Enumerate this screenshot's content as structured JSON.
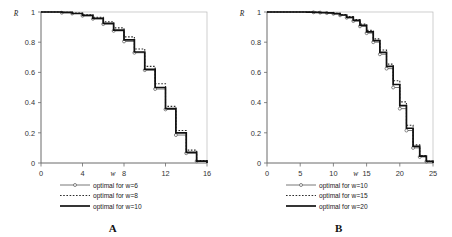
{
  "figure": {
    "panels": [
      {
        "id": "A",
        "caption": "A",
        "chart_data": {
          "type": "line",
          "title": "",
          "xlabel": "w",
          "ylabel": "R",
          "xlim": [
            0,
            16
          ],
          "ylim": [
            0,
            1
          ],
          "xticks": [
            0,
            4,
            8,
            12,
            16
          ],
          "xtick_labels": [
            "0",
            "4",
            "8",
            "12",
            "16"
          ],
          "yticks": [
            0,
            0.2,
            0.4,
            0.6,
            0.8,
            1
          ],
          "ytick_labels": [
            "0",
            "0.2",
            "0.4",
            "0.6",
            "0.8",
            "1"
          ],
          "grid": false,
          "legend_position": "below-axis",
          "step_style": "post",
          "series": [
            {
              "name": "optimal for w=6",
              "style": "thin-with-markers",
              "x": [
                0,
                1,
                2,
                3,
                4,
                5,
                6,
                7,
                8,
                9,
                10,
                11,
                12,
                13,
                14,
                15,
                16
              ],
              "values": [
                1.0,
                1.0,
                0.995,
                0.99,
                0.975,
                0.955,
                0.92,
                0.875,
                0.805,
                0.73,
                0.615,
                0.49,
                0.355,
                0.185,
                0.065,
                0.012,
                0.0
              ]
            },
            {
              "name": "optimal for w=8",
              "style": "dotted",
              "x": [
                0,
                1,
                2,
                3,
                4,
                5,
                6,
                7,
                8,
                9,
                10,
                11,
                12,
                13,
                14,
                15,
                16
              ],
              "values": [
                1.0,
                1.0,
                0.998,
                0.993,
                0.982,
                0.965,
                0.935,
                0.895,
                0.835,
                0.755,
                0.64,
                0.525,
                0.375,
                0.215,
                0.085,
                0.016,
                0.0
              ]
            },
            {
              "name": "optimal for w=10",
              "style": "thick",
              "x": [
                0,
                1,
                2,
                3,
                4,
                5,
                6,
                7,
                8,
                9,
                10,
                11,
                12,
                13,
                14,
                15,
                16
              ],
              "values": [
                1.0,
                1.0,
                0.997,
                0.99,
                0.978,
                0.958,
                0.925,
                0.88,
                0.815,
                0.735,
                0.62,
                0.5,
                0.36,
                0.2,
                0.07,
                0.013,
                0.0
              ]
            }
          ],
          "legend": [
            "optimal for w=6",
            "optimal for w=8",
            "optimal for w=10"
          ]
        }
      },
      {
        "id": "B",
        "caption": "B",
        "chart_data": {
          "type": "line",
          "title": "",
          "xlabel": "w",
          "ylabel": "R",
          "xlim": [
            0,
            25
          ],
          "ylim": [
            0,
            1
          ],
          "xticks": [
            0,
            5,
            10,
            15,
            20,
            25
          ],
          "xtick_labels": [
            "0",
            "5",
            "10",
            "15",
            "20",
            "25"
          ],
          "yticks": [
            0,
            0.2,
            0.4,
            0.6,
            0.8,
            1
          ],
          "ytick_labels": [
            "0",
            "0.2",
            "0.4",
            "0.6",
            "0.8",
            "1"
          ],
          "grid": false,
          "legend_position": "below-axis",
          "step_style": "post",
          "series": [
            {
              "name": "optimal for w=10",
              "style": "thin-with-markers",
              "x": [
                0,
                1,
                2,
                3,
                4,
                5,
                6,
                7,
                8,
                9,
                10,
                11,
                12,
                13,
                14,
                15,
                16,
                17,
                18,
                19,
                20,
                21,
                22,
                23,
                24,
                25
              ],
              "values": [
                1.0,
                1.0,
                1.0,
                1.0,
                1.0,
                1.0,
                0.999,
                0.998,
                0.996,
                0.993,
                0.988,
                0.978,
                0.962,
                0.94,
                0.905,
                0.86,
                0.8,
                0.72,
                0.625,
                0.5,
                0.36,
                0.215,
                0.1,
                0.04,
                0.01,
                0.0
              ]
            },
            {
              "name": "optimal for w=15",
              "style": "dotted",
              "x": [
                0,
                1,
                2,
                3,
                4,
                5,
                6,
                7,
                8,
                9,
                10,
                11,
                12,
                13,
                14,
                15,
                16,
                17,
                18,
                19,
                20,
                21,
                22,
                23,
                24,
                25
              ],
              "values": [
                1.0,
                1.0,
                1.0,
                1.0,
                1.0,
                1.0,
                0.999,
                0.999,
                0.997,
                0.995,
                0.991,
                0.983,
                0.97,
                0.95,
                0.92,
                0.878,
                0.822,
                0.748,
                0.655,
                0.545,
                0.405,
                0.25,
                0.12,
                0.05,
                0.013,
                0.0
              ]
            },
            {
              "name": "optimal for w=20",
              "style": "thick",
              "x": [
                0,
                1,
                2,
                3,
                4,
                5,
                6,
                7,
                8,
                9,
                10,
                11,
                12,
                13,
                14,
                15,
                16,
                17,
                18,
                19,
                20,
                21,
                22,
                23,
                24,
                25
              ],
              "values": [
                1.0,
                1.0,
                1.0,
                1.0,
                1.0,
                1.0,
                0.999,
                0.998,
                0.996,
                0.994,
                0.989,
                0.98,
                0.965,
                0.944,
                0.912,
                0.868,
                0.81,
                0.733,
                0.64,
                0.52,
                0.38,
                0.23,
                0.11,
                0.045,
                0.011,
                0.0
              ]
            }
          ],
          "legend": [
            "optimal for w=10",
            "optimal for w=15",
            "optimal for w=20"
          ]
        }
      }
    ]
  }
}
